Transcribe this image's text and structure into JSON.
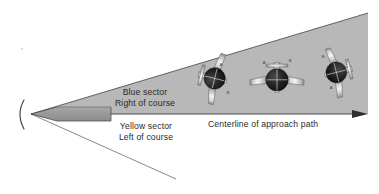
{
  "figure": {
    "background_color": "#ffffff"
  },
  "sectors": {
    "blue": {
      "name": "blue-sector",
      "line1": "Blue sector",
      "line2": "Right of course",
      "fill_color": "#b8b8b8",
      "side": "upper"
    },
    "yellow": {
      "name": "yellow-sector",
      "line1": "Yellow sector",
      "line2": "Left of course",
      "fill_color": "#ffffff",
      "side": "lower"
    }
  },
  "centerline": {
    "label": "Centerline of approach path",
    "color": "#3a3a3a"
  },
  "runway": {
    "name": "runway",
    "fill_color": "#9a9a9a",
    "stroke_color": "#4a4a4a"
  },
  "antenna": {
    "name": "localizer-antenna",
    "glyph": "(",
    "color": "#3a3a3a"
  },
  "aircraft": [
    {
      "id": "aircraft-left",
      "position": "left",
      "bank": "steep-right-bank",
      "marks": [
        "A",
        "B"
      ]
    },
    {
      "id": "aircraft-center",
      "position": "center",
      "bank": "wings-level",
      "marks": [
        "A",
        "B"
      ]
    },
    {
      "id": "aircraft-right",
      "position": "right",
      "bank": "steep-left-bank",
      "marks": [
        "B",
        "A"
      ]
    }
  ],
  "colors": {
    "sector_gray": "#b8b8b8",
    "line_dark": "#3a3a3a",
    "fuselage_light": "#e3e3e3",
    "fuselage_mid": "#bdbdbd",
    "nose_dark": "#1c1c1c",
    "outline": "#5a5a5a",
    "text": "#2a2a2a"
  },
  "speck": {
    "name": "dust-speck",
    "color": "#c9c9c9"
  }
}
